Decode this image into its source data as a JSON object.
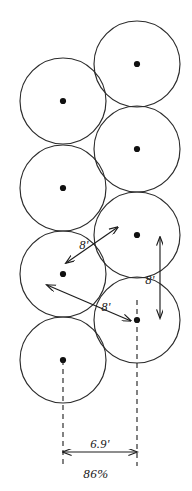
{
  "diagram": {
    "type": "sprinkler-coverage-layout",
    "geometry": {
      "canvas_width": 192,
      "canvas_height": 491,
      "circle_radius_px": 43,
      "left_column_center_x": 63,
      "right_column_center_x": 137,
      "row_spacing_px": 86,
      "column_vertical_offset_px": 43,
      "stroke_color": "#2b2b2b",
      "dot_color": "#101010"
    },
    "circles": [
      {
        "name": "circle-right-1",
        "cx": 137,
        "cy": 64,
        "r": 43
      },
      {
        "name": "circle-left-1",
        "cx": 63,
        "cy": 101,
        "r": 43
      },
      {
        "name": "circle-right-2",
        "cx": 137,
        "cy": 149,
        "r": 43
      },
      {
        "name": "circle-left-2",
        "cx": 63,
        "cy": 188,
        "r": 43
      },
      {
        "name": "circle-right-3",
        "cx": 137,
        "cy": 235,
        "r": 43
      },
      {
        "name": "circle-left-3",
        "cx": 63,
        "cy": 274,
        "r": 43
      },
      {
        "name": "circle-right-4",
        "cx": 137,
        "cy": 320,
        "r": 43
      },
      {
        "name": "circle-left-4",
        "cx": 63,
        "cy": 360,
        "r": 43
      }
    ],
    "center_dots": [
      {
        "name": "dot-right-1",
        "cx": 137,
        "cy": 64
      },
      {
        "name": "dot-left-1",
        "cx": 63,
        "cy": 101
      },
      {
        "name": "dot-right-2",
        "cx": 137,
        "cy": 149
      },
      {
        "name": "dot-left-2",
        "cx": 63,
        "cy": 188
      },
      {
        "name": "dot-right-3",
        "cx": 137,
        "cy": 235
      },
      {
        "name": "dot-left-3",
        "cx": 63,
        "cy": 274
      },
      {
        "name": "dot-right-4",
        "cx": 137,
        "cy": 320
      },
      {
        "name": "dot-left-4",
        "cx": 63,
        "cy": 360
      }
    ],
    "dimensions": {
      "diagonal_upper": {
        "label": "8'",
        "label_x": 84,
        "label_y": 249,
        "from_x": 118,
        "from_y": 227,
        "to_x": 66,
        "to_y": 263
      },
      "diagonal_lower": {
        "label": "8'",
        "label_x": 106,
        "label_y": 311,
        "from_x": 131,
        "from_y": 321,
        "to_x": 47,
        "to_y": 285
      },
      "vertical": {
        "label": "8'",
        "label_x": 148,
        "label_y": 282,
        "x": 160,
        "from_y": 237,
        "to_y": 318
      },
      "horizontal": {
        "label": "6.9'",
        "label_x": 100,
        "label_y": 446,
        "y": 452,
        "from_x": 63,
        "to_x": 137
      }
    },
    "centerlines": [
      {
        "name": "centerline-left",
        "x": 63,
        "from_y": 360,
        "to_y": 466
      },
      {
        "name": "centerline-right",
        "x": 137,
        "from_y": 300,
        "to_y": 466
      }
    ],
    "coverage": {
      "label": "86%",
      "label_x": 96,
      "label_y": 477
    }
  }
}
